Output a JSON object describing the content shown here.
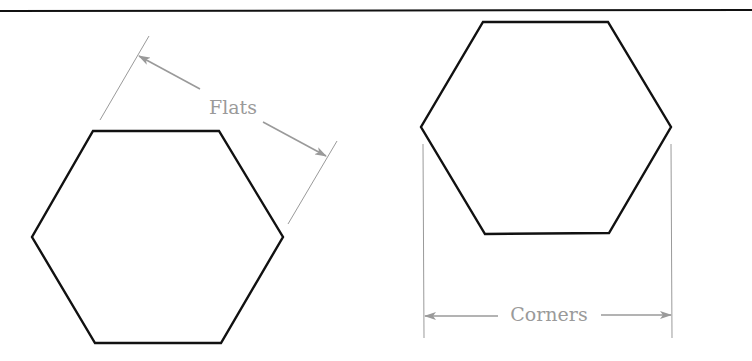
{
  "diagram": {
    "colors": {
      "shape_stroke": "#111111",
      "dimension_stroke": "#9a9a9a",
      "rule": "#111111",
      "background": "#ffffff"
    },
    "left_figure": {
      "shape": "hexagon",
      "orientation": "flat-top",
      "dimension_label": "Flats",
      "description": "Distance measured across parallel flat sides"
    },
    "right_figure": {
      "shape": "hexagon",
      "orientation": "flat-top",
      "dimension_label": "Corners",
      "description": "Distance measured across opposite corners"
    }
  }
}
